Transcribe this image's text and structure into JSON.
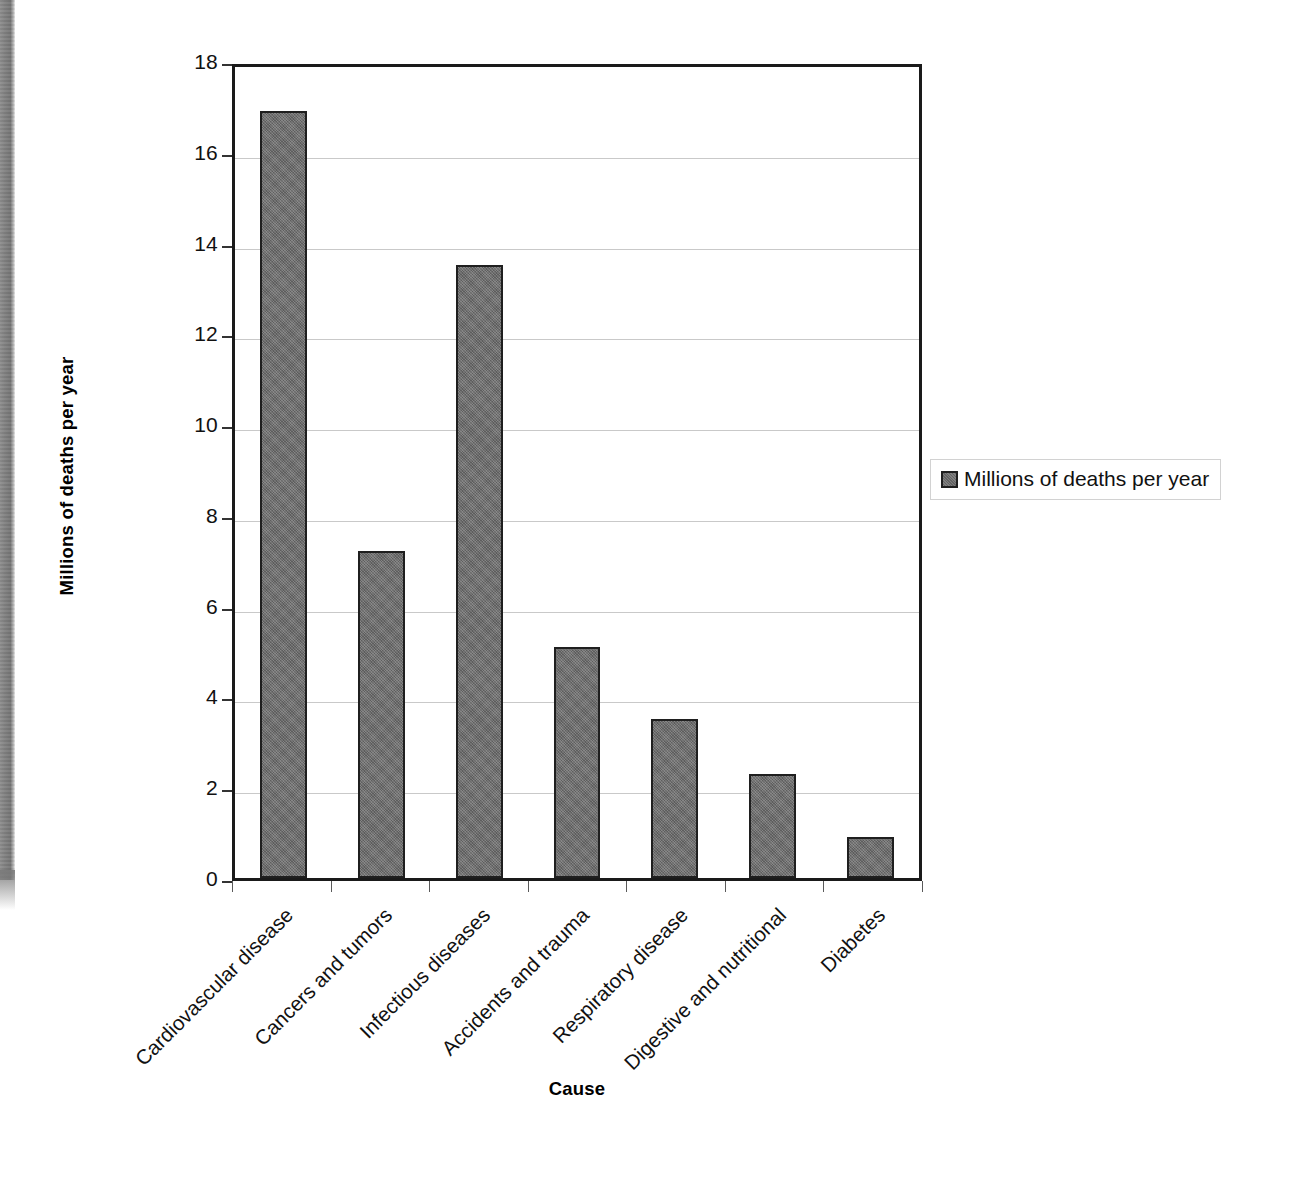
{
  "chart_data": {
    "type": "bar",
    "title": "",
    "xlabel": "Cause",
    "ylabel": "Millions of deaths per year",
    "categories": [
      "Cardiovascular disease",
      "Cancers and tumors",
      "Infectious diseases",
      "Accidents and trauma",
      "Respiratory disease",
      "Digestive and nutritional",
      "Diabetes"
    ],
    "values": [
      16.9,
      7.2,
      13.5,
      5.1,
      3.5,
      2.3,
      0.9
    ],
    "series": [
      {
        "name": "Millions of deaths per year",
        "values": [
          16.9,
          7.2,
          13.5,
          5.1,
          3.5,
          2.3,
          0.9
        ]
      }
    ],
    "ylim": [
      0,
      18
    ],
    "ytick_values": [
      0,
      2,
      4,
      6,
      8,
      10,
      12,
      14,
      16,
      18
    ],
    "ytick_labels": [
      "0",
      "2",
      "4",
      "6",
      "8",
      "10",
      "12",
      "14",
      "16",
      "18"
    ],
    "grid": "horizontal",
    "legend_position": "right",
    "bar_color": "#6e6e6e",
    "bar_border_color": "#1f1f1f",
    "grid_color": "#c9c9c9",
    "axis_color": "#1a1a1a"
  },
  "legend": {
    "entries": [
      {
        "label": "Millions of deaths per year"
      }
    ]
  },
  "axis_titles": {
    "x": "Cause",
    "y": "Millions of deaths per year"
  }
}
